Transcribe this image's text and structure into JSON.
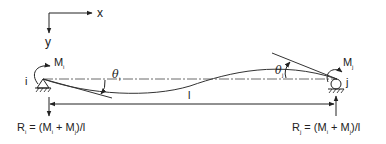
{
  "diagram": {
    "axes": {
      "x_label": "x",
      "y_label": "y"
    },
    "left_node": {
      "label": "i",
      "moment_label": "M",
      "moment_sub": "i",
      "rotation_label": "θ",
      "rotation_sub": "i",
      "support": "pin"
    },
    "right_node": {
      "label": "j",
      "moment_label": "M",
      "moment_sub": "j",
      "rotation_label": "θ",
      "rotation_sub": "j",
      "support": "roller"
    },
    "span_label": "l",
    "reactions": {
      "left": {
        "R": "R",
        "sub": "i",
        "expr": " = (M",
        "s1": "i",
        "mid": " + M",
        "s2": "j",
        "tail": ")/l"
      },
      "right": {
        "R": "R",
        "sub": "j",
        "expr": " = (M",
        "s1": "i",
        "mid": " + M",
        "s2": "j",
        "tail": ")/l"
      }
    },
    "colors": {
      "line": "#222222",
      "background": "#ffffff"
    }
  }
}
